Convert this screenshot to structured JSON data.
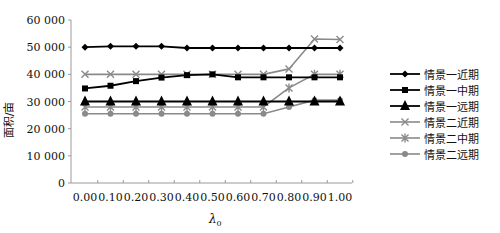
{
  "chart_data": {
    "type": "line",
    "title": "",
    "xlabel": "λ0",
    "ylabel": "面积/亩",
    "x": [
      0.0,
      0.1,
      0.2,
      0.3,
      0.4,
      0.5,
      0.6,
      0.7,
      0.8,
      0.9,
      1.0
    ],
    "x_tick_labels": [
      "0.00",
      "0.10",
      "0.20",
      "0.30",
      "0.40",
      "0.50",
      "0.60",
      "0.70",
      "0.80",
      "0.90",
      "1.00"
    ],
    "y_tick_labels": [
      "0",
      "10 000",
      "20 000",
      "30 000",
      "40 000",
      "50 000",
      "60 000"
    ],
    "ylim": [
      0,
      60000
    ],
    "grid": false,
    "legend_position": "right",
    "series": [
      {
        "name": "情景一近期",
        "color": "#000000",
        "marker": "diamond",
        "values": [
          50000,
          50300,
          50300,
          50300,
          49700,
          49700,
          49700,
          49700,
          49700,
          49700,
          49700
        ]
      },
      {
        "name": "情景一中期",
        "color": "#000000",
        "marker": "square",
        "values": [
          34800,
          35800,
          37500,
          38800,
          39700,
          40000,
          38900,
          38900,
          38900,
          38900,
          38900
        ]
      },
      {
        "name": "情景一远期",
        "color": "#000000",
        "marker": "triangle",
        "values": [
          30000,
          30000,
          30000,
          30000,
          30000,
          30000,
          30000,
          30000,
          30000,
          30000,
          30000
        ]
      },
      {
        "name": "情景二近期",
        "color": "#8a8a8a",
        "marker": "x",
        "values": [
          40000,
          40000,
          40000,
          40000,
          40000,
          40000,
          40000,
          40000,
          42000,
          53000,
          52800
        ]
      },
      {
        "name": "情景二中期",
        "color": "#8a8a8a",
        "marker": "asterisk",
        "values": [
          28000,
          28000,
          28000,
          28000,
          28000,
          28000,
          28000,
          28000,
          35000,
          40000,
          40000
        ]
      },
      {
        "name": "情景二远期",
        "color": "#8a8a8a",
        "marker": "circle",
        "values": [
          25500,
          25500,
          25500,
          25500,
          25500,
          25500,
          25500,
          25500,
          28000,
          30500,
          30500
        ]
      }
    ]
  }
}
